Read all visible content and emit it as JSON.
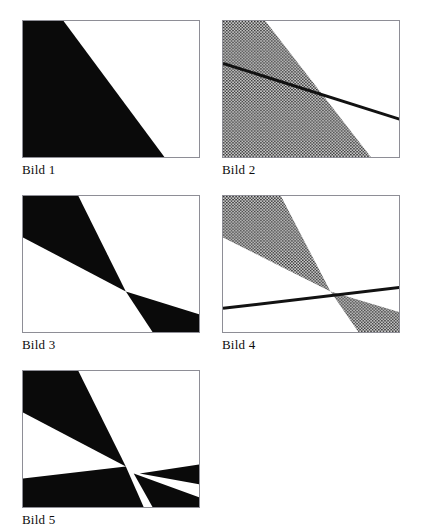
{
  "page": {
    "background": "#ffffff",
    "width": 429,
    "height": 532,
    "frame_border_color": "#8e8e96",
    "fill_black": "#0a0a0a",
    "fill_dotted_base": "#c9c9c9",
    "fill_dotted_dot": "#2a2a2a",
    "line_color": "#121212"
  },
  "figures": [
    {
      "id": "bild-1",
      "caption": "Bild 1",
      "fill_style": "solid-black",
      "has_line": false,
      "description": "single black triangular half-plane region, boundary from top edge down to bottom edge",
      "regions": [
        {
          "name": "half-plane",
          "points": "0,0 41,0 143,138 0,138"
        }
      ],
      "lines": []
    },
    {
      "id": "bild-2",
      "caption": "Bild 2",
      "fill_style": "dotted-gray",
      "has_line": true,
      "description": "dotted half-plane region with a solid boundary line crossing it",
      "regions": [
        {
          "name": "half-plane",
          "points": "0,0 41,0 143,138 0,138"
        }
      ],
      "lines": [
        {
          "name": "constraint-line",
          "x1": 0,
          "y1": 43,
          "x2": 178,
          "y2": 102
        }
      ]
    },
    {
      "id": "bild-3",
      "caption": "Bild 3",
      "fill_style": "solid-black",
      "has_line": false,
      "description": "black bowtie formed by two opposing wedges meeting near the centre",
      "regions": [
        {
          "name": "upper-wedge",
          "points": "0,0 56,0 104,97 0,42"
        },
        {
          "name": "lower-wedge",
          "points": "104,97 178,120 178,138 131,138"
        }
      ],
      "lines": []
    },
    {
      "id": "bild-4",
      "caption": "Bild 4",
      "fill_style": "dotted-gray",
      "has_line": true,
      "description": "dotted bowtie of two opposing wedges with a solid near-horizontal line through the crossing point",
      "regions": [
        {
          "name": "upper-wedge",
          "points": "0,0 56,0 104,97 0,42"
        },
        {
          "name": "lower-wedge",
          "points": "104,97 178,120 178,138 131,138"
        }
      ],
      "lines": [
        {
          "name": "constraint-line",
          "x1": 0,
          "y1": 114,
          "x2": 178,
          "y2": 92
        }
      ]
    },
    {
      "id": "bild-5",
      "caption": "Bild 5",
      "fill_style": "solid-black",
      "has_line": false,
      "description": "black bowtie plus a second black band crossing from lower left, creating four wedges around the centre",
      "regions": [
        {
          "name": "upper-wedge",
          "points": "0,0 56,0 104,97 0,42"
        },
        {
          "name": "lower-left-band",
          "points": "0,109 104,97 122,138 0,138"
        },
        {
          "name": "right-wedge",
          "points": "118,104 178,95 178,115"
        },
        {
          "name": "lower-right-wedge",
          "points": "112,104 178,128 178,138 131,138"
        }
      ],
      "lines": []
    }
  ]
}
